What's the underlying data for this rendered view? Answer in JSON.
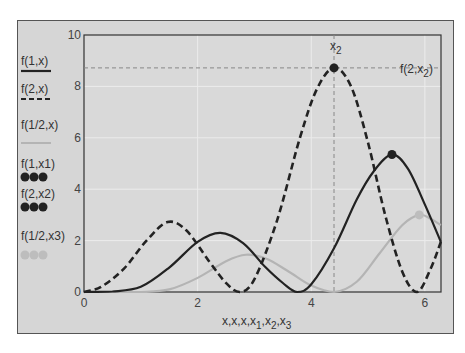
{
  "chart_data": {
    "type": "line",
    "title": "",
    "xlabel": "x,x,x,x1,x2,x3",
    "ylabel": "",
    "xlim": [
      0,
      6.283
    ],
    "ylim": [
      0,
      10
    ],
    "x_ticks": [
      "0",
      "2",
      "4",
      "6"
    ],
    "y_ticks": [
      "0",
      "2",
      "4",
      "6",
      "8",
      "10"
    ],
    "grid": true,
    "legend_position": "left",
    "series": [
      {
        "name": "f(1,x)",
        "style": "solid",
        "color": "#222222",
        "x": [
          0,
          0.5,
          1.0,
          1.5,
          2.0,
          2.4,
          2.8,
          3.2,
          3.5,
          3.75,
          4.0,
          4.4,
          4.8,
          5.1,
          5.42,
          5.7,
          6.0,
          6.28
        ],
        "y": [
          0,
          0.02,
          0.2,
          0.95,
          1.95,
          2.3,
          1.9,
          0.95,
          0.35,
          0.0,
          0.3,
          1.7,
          3.6,
          4.7,
          5.35,
          4.8,
          3.4,
          1.95
        ]
      },
      {
        "name": "f(2,x)",
        "style": "dashed",
        "color": "#222222",
        "x": [
          0,
          0.3,
          0.7,
          1.1,
          1.47,
          1.8,
          2.2,
          2.5,
          2.74,
          3.0,
          3.4,
          3.8,
          4.1,
          4.4,
          4.7,
          5.0,
          5.3,
          5.6,
          5.86,
          6.1,
          6.28
        ],
        "y": [
          0,
          0.2,
          0.9,
          2.0,
          2.72,
          2.4,
          1.2,
          0.35,
          0.0,
          0.5,
          2.8,
          6.0,
          7.9,
          8.72,
          8.0,
          5.8,
          3.0,
          0.8,
          0.0,
          0.9,
          1.95
        ]
      },
      {
        "name": "f(1/2,x)",
        "style": "solid",
        "color": "#b4b4b4",
        "x": [
          0,
          0.5,
          1.0,
          1.5,
          2.0,
          2.5,
          2.85,
          3.2,
          3.6,
          4.0,
          4.4,
          4.8,
          5.2,
          5.6,
          5.9,
          6.1,
          6.28
        ],
        "y": [
          0,
          0.0,
          0.0,
          0.1,
          0.55,
          1.2,
          1.45,
          1.3,
          0.8,
          0.25,
          0.0,
          0.4,
          1.5,
          2.6,
          3.0,
          2.85,
          2.6
        ]
      }
    ],
    "markers": [
      {
        "name": "f(1,x1)",
        "x": 5.42,
        "y": 5.35,
        "color": "#222222"
      },
      {
        "name": "f(2,x2)",
        "x": 4.4,
        "y": 8.72,
        "color": "#222222"
      },
      {
        "name": "f(1/2,x3)",
        "x": 5.9,
        "y": 3.0,
        "color": "#bdbdbd"
      }
    ],
    "annotations": [
      {
        "text": "x2",
        "type": "vertical-line",
        "x": 4.4
      },
      {
        "text": "f(2,x2)",
        "type": "horizontal-line",
        "y": 8.72
      }
    ]
  },
  "legend": [
    {
      "label": "f(1,x)",
      "kind": "line-solid"
    },
    {
      "label": "f(2,x)",
      "kind": "line-dashed"
    },
    {
      "label": "f(1/2,x)",
      "kind": "line-light"
    },
    {
      "label": "f(1,x1)",
      "kind": "dots-dark"
    },
    {
      "label": "f(2,x2)",
      "kind": "dots-dark"
    },
    {
      "label": "f(1/2,x3)",
      "kind": "dots-light"
    }
  ],
  "axis": {
    "xlabel_main": "x,x,x,x",
    "xlabel_subs": [
      "1",
      "2",
      "3"
    ],
    "vline_label": "x",
    "vline_sub": "2",
    "hline_label_pre": "f(2,x",
    "hline_label_sub": "2",
    "hline_label_post": ")"
  }
}
